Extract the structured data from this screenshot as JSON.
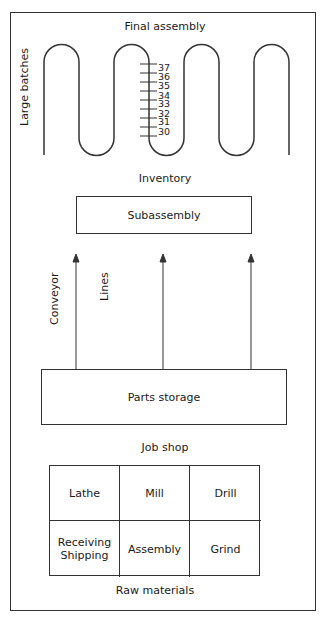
{
  "title": "Final assembly",
  "serpentine": {
    "side_label": "Large batches",
    "scale_ticks": [
      "37",
      "36",
      "35",
      "34",
      "33",
      "32",
      "31",
      "30"
    ]
  },
  "inventory_label": "Inventory",
  "subassembly": {
    "label": "Subassembly"
  },
  "conveyor": {
    "label_1": "Conveyor",
    "label_2": "Lines",
    "arrow_count": 3
  },
  "parts_storage": {
    "label": "Parts storage"
  },
  "job_shop": {
    "label": "Job shop",
    "cells": [
      [
        "Lathe",
        "Mill",
        "Drill"
      ],
      [
        "Receiving\nShipping",
        "Assembly",
        "Grind"
      ]
    ]
  },
  "raw_materials_label": "Raw materials",
  "colors": {
    "line": "#333333",
    "background": "#ffffff",
    "text": "#1a1a1a"
  }
}
